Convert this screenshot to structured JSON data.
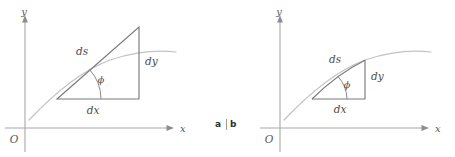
{
  "figure": {
    "panels": [
      {
        "id": "a",
        "caption": "a",
        "axis_x_label": "x",
        "axis_y_label": "y",
        "origin_label": "O",
        "labels": {
          "hypotenuse": "ds",
          "vertical": "dy",
          "horizontal": "dx",
          "angle": "ϕ"
        },
        "description": "Tangent line triangle: ds drawn as straight hypotenuse of right triangle tangent to the curve"
      },
      {
        "id": "b",
        "caption": "b",
        "axis_x_label": "x",
        "axis_y_label": "y",
        "origin_label": "O",
        "labels": {
          "hypotenuse": "ds",
          "vertical": "dy",
          "horizontal": "dx",
          "angle": "ϕ"
        },
        "description": "Arc triangle: ds drawn along the curve itself as the hypotenuse"
      }
    ],
    "divider": "|",
    "colors": {
      "axis": "#a8a8a8",
      "curve": "#c2c2c2",
      "triangle": "#7a7a7a",
      "label_text": "#4d4d4d",
      "caption_text": "#2e2e2e",
      "background": "#ffffff"
    }
  }
}
